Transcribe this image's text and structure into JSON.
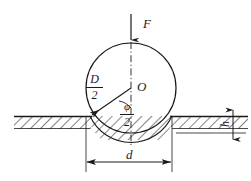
{
  "figure": {
    "background_color": "#ffffff",
    "line_color": "#1a1a1a",
    "width": 251,
    "height": 181
  },
  "labels": {
    "force": "F",
    "center": "O",
    "diameter_numerator": "D",
    "diameter_denominator": "2",
    "angle_numerator": "φ",
    "angle_denominator": "2",
    "indent_diameter": "d",
    "indent_depth": "h"
  },
  "geometry": {
    "circle": {
      "cx": 131,
      "cy": 88,
      "r": 45
    },
    "ground_y": 116,
    "indent_bottom_y": 133,
    "centerline_x": 131,
    "force_arrow": {
      "x": 131,
      "y_start": 14,
      "y_end": 43
    },
    "radius_line": {
      "from_x": 131,
      "from_y": 88,
      "to_x": 90,
      "to_y": 116
    },
    "d_dimension": {
      "left_x": 86,
      "right_x": 172,
      "y": 162
    },
    "h_dimension": {
      "x": 233,
      "top_y": 116,
      "bottom_y": 133
    },
    "ground_left_x": 14,
    "ground_right_x": 248
  },
  "icons": {
    "force_arrow": "down-arrow-icon",
    "radius_arrow": "radius-arrow-icon",
    "dimension_arrow": "dimension-arrow-icon",
    "angle_arc": "angle-arc-icon",
    "hatching": "hatch-pattern-icon",
    "centerline": "center-dash-dot-line-icon"
  }
}
